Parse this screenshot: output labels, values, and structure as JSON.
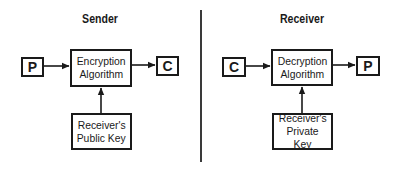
{
  "sender": {
    "title": "Sender",
    "input_label": "P",
    "process_lines": [
      "Encryption",
      "Algorithm"
    ],
    "output_label": "C",
    "key_lines": [
      "Receiver's",
      "Public Key"
    ]
  },
  "receiver": {
    "title": "Receiver",
    "input_label": "C",
    "process_lines": [
      "Decryption",
      "Algorithm"
    ],
    "output_label": "P",
    "key_lines": [
      "Receiver's",
      "Private Key"
    ]
  },
  "colors": {
    "stroke": "#1a1a1a",
    "divider": "#3a3a3a",
    "background": "#ffffff"
  }
}
